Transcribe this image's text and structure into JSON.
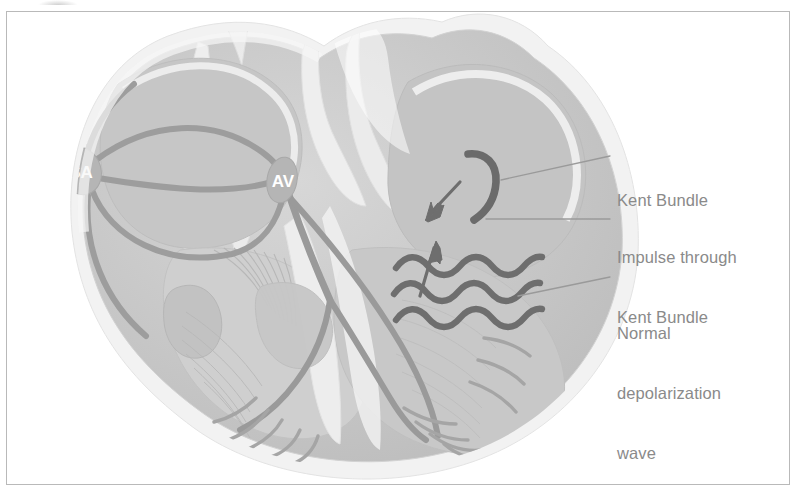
{
  "figure": {
    "style": "grayscale medical illustration",
    "frame": {
      "border_color": "#b9b9b9",
      "background": "#ffffff"
    }
  },
  "nodes": [
    {
      "id": "sa-node",
      "label": "SA",
      "name": "sinoatrial-node",
      "cx": 81,
      "cy": 171,
      "rx": 20,
      "ry": 24,
      "rotation": -18
    },
    {
      "id": "av-node",
      "label": "AV",
      "name": "atrioventricular-node",
      "cx": 282,
      "cy": 180,
      "rx": 15,
      "ry": 22,
      "rotation": 8
    }
  ],
  "labels": [
    {
      "id": "kent-bundle",
      "text": "Kent Bundle",
      "lines": [
        "Kent Bundle"
      ]
    },
    {
      "id": "impulse-through-kent-bundle",
      "text": "Impulse through Kent Bundle",
      "lines": [
        "Impulse through",
        "Kent Bundle"
      ]
    },
    {
      "id": "normal-depolarization-wave",
      "text": "Normal depolarization wave",
      "lines": [
        "Normal",
        "depolarization",
        "wave"
      ]
    }
  ],
  "leaders": [
    {
      "for": "kent-bundle",
      "from": [
        501,
        180
      ],
      "to": [
        610,
        156
      ]
    },
    {
      "for": "impulse-through-kent-bundle",
      "from": [
        486,
        219
      ],
      "to": [
        610,
        219
      ]
    },
    {
      "for": "normal-depolarization-wave",
      "from": [
        518,
        296
      ],
      "to": [
        610,
        277
      ]
    }
  ],
  "colors": {
    "tissue_mid": "#c9c9c9",
    "tissue_light": "#e2e2e2",
    "tissue_pale": "#f1f1f1",
    "chamber_fill": "#c3c3c3",
    "conduction_path": "#9a9a9a",
    "accessory_path": "#6b6b6b",
    "depolarization_wave": "#6e6e6e",
    "label_text": "#8a8a8a",
    "leader_line": "#9a9a9a",
    "node_fill": "#b5b5b5",
    "node_text": "#ffffff",
    "frame_border": "#b9b9b9",
    "background": "#ffffff"
  }
}
